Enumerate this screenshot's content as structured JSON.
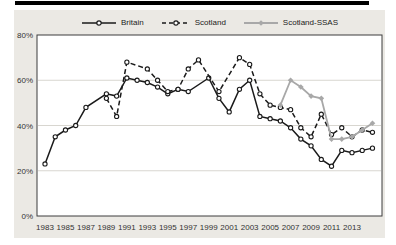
{
  "colors": {
    "top_rule": "#000000",
    "panel_background": "#EBE9E4",
    "plot_background": "#FFFFFF",
    "plot_frame": "#3d3d3d",
    "gridline": "#D8D6D0",
    "black_series": "#1a1a1a",
    "gray_series": "#A8A8A8",
    "tick_text": "#333333"
  },
  "chart_data": {
    "type": "line",
    "title": "",
    "xlabel": "",
    "ylabel": "",
    "ylim": [
      0,
      80
    ],
    "xlim": [
      1982,
      2016
    ],
    "grid": "horizontal",
    "legend_position": "top-center",
    "x_ticks": [
      1983,
      1985,
      1987,
      1989,
      1991,
      1993,
      1995,
      1997,
      1999,
      2001,
      2003,
      2005,
      2007,
      2009,
      2011,
      2013
    ],
    "y_ticks": [
      {
        "value": 80,
        "label": "80%"
      },
      {
        "value": 60,
        "label": "60%"
      },
      {
        "value": 40,
        "label": "40%"
      },
      {
        "value": 20,
        "label": "20%"
      },
      {
        "value": 0,
        "label": "0%"
      }
    ],
    "series": [
      {
        "name": "Britain",
        "color": "#1a1a1a",
        "dash": "",
        "width": 1.5,
        "marker": "circle",
        "points": [
          [
            1983,
            23
          ],
          [
            1984,
            35
          ],
          [
            1985,
            38
          ],
          [
            1986,
            40
          ],
          [
            1987,
            48
          ],
          [
            1989,
            54
          ],
          [
            1990,
            53
          ],
          [
            1991,
            61
          ],
          [
            1992,
            60
          ],
          [
            1993,
            59
          ],
          [
            1994,
            57
          ],
          [
            1995,
            54
          ],
          [
            1996,
            56
          ],
          [
            1997,
            55
          ],
          [
            1999,
            61
          ],
          [
            2000,
            52
          ],
          [
            2001,
            46
          ],
          [
            2002,
            56
          ],
          [
            2003,
            60
          ],
          [
            2004,
            44
          ],
          [
            2005,
            43
          ],
          [
            2006,
            42
          ],
          [
            2007,
            39
          ],
          [
            2008,
            34
          ],
          [
            2009,
            31
          ],
          [
            2010,
            25
          ],
          [
            2011,
            22
          ],
          [
            2012,
            29
          ],
          [
            2013,
            28
          ],
          [
            2014,
            29
          ],
          [
            2015,
            30
          ]
        ]
      },
      {
        "name": "Scotland",
        "color": "#1a1a1a",
        "dash": "5 3",
        "width": 1.5,
        "marker": "circle",
        "points": [
          [
            1989,
            52
          ],
          [
            1990,
            44
          ],
          [
            1991,
            68
          ],
          [
            1993,
            65
          ],
          [
            1994,
            60
          ],
          [
            1995,
            55
          ],
          [
            1996,
            56
          ],
          [
            1997,
            65
          ],
          [
            1998,
            69
          ],
          [
            2000,
            55
          ],
          [
            2002,
            70
          ],
          [
            2003,
            67
          ],
          [
            2004,
            54
          ],
          [
            2005,
            49
          ],
          [
            2006,
            48
          ],
          [
            2007,
            47
          ],
          [
            2008,
            39
          ],
          [
            2009,
            35
          ],
          [
            2010,
            45
          ],
          [
            2011,
            36
          ],
          [
            2012,
            39
          ],
          [
            2013,
            35
          ],
          [
            2014,
            38
          ],
          [
            2015,
            37
          ]
        ]
      },
      {
        "name": "Scotland-SSAS",
        "color": "#A8A8A8",
        "dash": "",
        "width": 1.8,
        "marker": "diamond",
        "points": [
          [
            2006,
            49
          ],
          [
            2007,
            60
          ],
          [
            2008,
            57
          ],
          [
            2009,
            53
          ],
          [
            2010,
            52
          ],
          [
            2011,
            34
          ],
          [
            2012,
            34
          ],
          [
            2013,
            35
          ],
          [
            2014,
            38
          ],
          [
            2015,
            41
          ]
        ]
      }
    ]
  }
}
